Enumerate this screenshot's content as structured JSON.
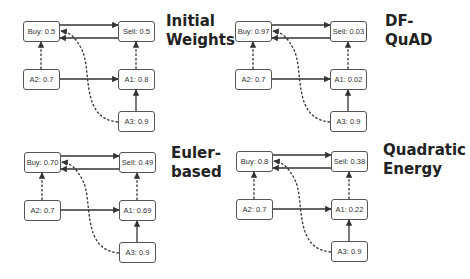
{
  "panels": [
    {
      "title": "Initial\nWeights",
      "nodes": {
        "buy": "Buy: 0.5",
        "sell": "Sell: 0.5",
        "a2": "A2: 0.7",
        "a1": "A1: 0.8",
        "a3": "A3: 0.9"
      }
    },
    {
      "title": "DF-QuAD",
      "nodes": {
        "buy": "Buy: 0.97",
        "sell": "Sell: 0.03",
        "a2": "A2: 0.7",
        "a1": "A1: 0.02",
        "a3": "A3: 0.9"
      }
    },
    {
      "title": "Euler-\nbased",
      "nodes": {
        "buy": "Buy: 0.70",
        "sell": "Sell: 0.49",
        "a2": "A2: 0.7",
        "a1": "A1: 0.69",
        "a3": "A3: 0.9"
      }
    },
    {
      "title": "Quadratic\nEnergy",
      "nodes": {
        "buy": "Buy: 0.8",
        "sell": "Sell: 0.38",
        "a2": "A2: 0.7",
        "a1": "A1: 0.22",
        "a3": "A3: 0.9"
      }
    }
  ],
  "edges": [
    {
      "from": "buy",
      "to": "sell",
      "style": "solid"
    },
    {
      "from": "sell",
      "to": "buy",
      "style": "solid"
    },
    {
      "from": "a2",
      "to": "buy",
      "style": "dashed"
    },
    {
      "from": "a1",
      "to": "sell",
      "style": "dashed"
    },
    {
      "from": "a2",
      "to": "a1",
      "style": "solid"
    },
    {
      "from": "a3",
      "to": "a1",
      "style": "solid"
    },
    {
      "from": "a3",
      "to": "buy",
      "style": "dashed-curve"
    }
  ],
  "colors": {
    "edge": "#333333",
    "node_border": "#555555",
    "text": "#222222"
  }
}
